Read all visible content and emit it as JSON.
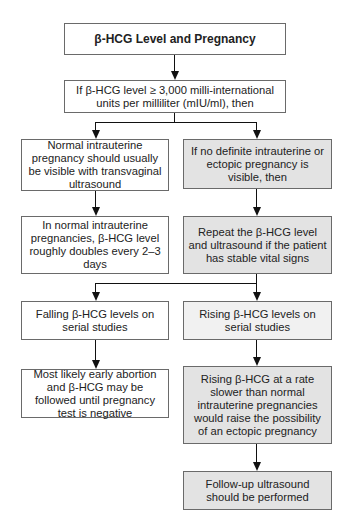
{
  "diagram": {
    "title": "β-HCG Level and Pregnancy",
    "condition": "If β-HCG level ≥ 3,000 milli-international units per milliliter (mIU/ml), then",
    "left_branch": {
      "step1": "Normal intrauterine pregnancy should usually be visible with transvaginal ultrasound",
      "step2": "In normal intrauterine pregnancies, β-HCG level roughly doubles every 2–3 days"
    },
    "right_branch": {
      "step1": "If no definite intrauterine or ectopic pregnancy is visible, then",
      "step2": "Repeat the β-HCG level and ultrasound if the patient has stable vital signs"
    },
    "outcomes": {
      "falling": "Falling β-HCG levels on serial studies",
      "falling_result": "Most likely early abortion and β-HCG may be followed until pregnancy test is negative",
      "rising": "Rising β-HCG levels on serial studies",
      "rising_result": "Rising β-HCG at a rate slower than normal intrauterine pregnancies would raise the possibility of an ectopic pregnancy",
      "followup": "Follow-up ultrasound should be performed"
    },
    "colors": {
      "border": "#6a6a6a",
      "shaded_fill": "#e3e3e3",
      "connector": "#111111"
    }
  }
}
